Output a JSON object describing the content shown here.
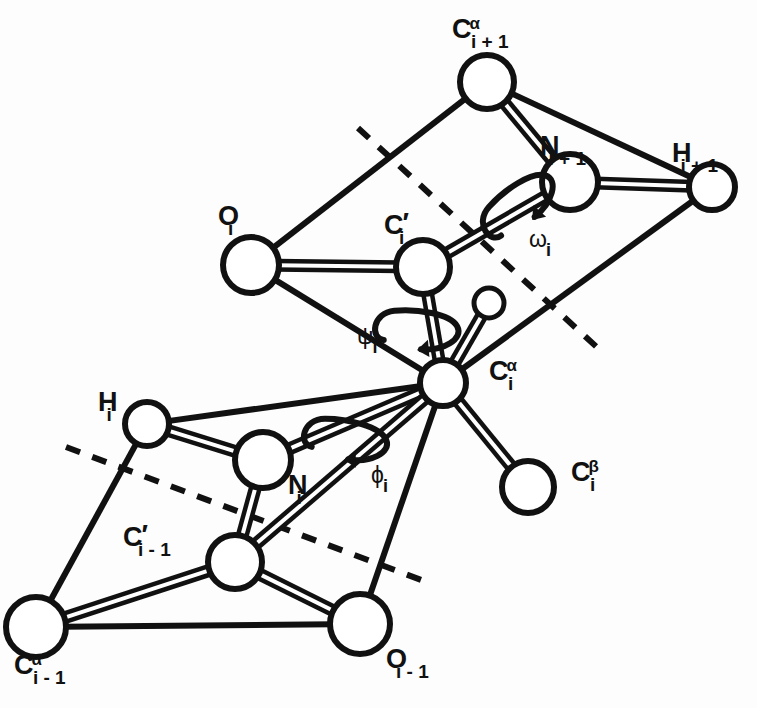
{
  "figure": {
    "kind": "molecular-structure-diagram",
    "background_color": "#ffffff",
    "line_color": "#111111",
    "atom_fill_color": "#ffffff"
  },
  "atoms": [
    {
      "id": "ca_ip1",
      "name": "c-alpha-i-plus-1",
      "base": "C",
      "sup": "α",
      "sub": "i + 1",
      "x": 487,
      "y": 82,
      "r": 27,
      "label_x": 452,
      "label_y": 14
    },
    {
      "id": "n_ip1",
      "name": "n-i-plus-1",
      "base": "N",
      "sup": "",
      "sub": "i + 1",
      "x": 570,
      "y": 182,
      "r": 28,
      "label_x": 540,
      "label_y": 133
    },
    {
      "id": "h_ip1",
      "name": "h-i-plus-1",
      "base": "H",
      "sup": "",
      "sub": "i + 1",
      "x": 712,
      "y": 187,
      "r": 23,
      "label_x": 672,
      "label_y": 140
    },
    {
      "id": "o_i",
      "name": "o-i",
      "base": "O",
      "sup": "",
      "sub": "i",
      "x": 251,
      "y": 265,
      "r": 28,
      "label_x": 218,
      "label_y": 203
    },
    {
      "id": "cp_i",
      "name": "c-prime-i",
      "base": "C",
      "sup": "",
      "sub": "i",
      "x": 423,
      "y": 267,
      "r": 27,
      "label_x": 384,
      "label_y": 212,
      "prime": true
    },
    {
      "id": "h_ca",
      "name": "h-alpha-i",
      "base": "",
      "sup": "",
      "sub": "",
      "x": 489,
      "y": 303,
      "r": 15,
      "label_x": 0,
      "label_y": 0
    },
    {
      "id": "ca_i",
      "name": "c-alpha-i",
      "base": "C",
      "sup": "α",
      "sub": "i",
      "x": 443,
      "y": 383,
      "r": 23,
      "label_x": 489,
      "label_y": 356
    },
    {
      "id": "cb_i",
      "name": "c-beta-i",
      "base": "C",
      "sup": "β",
      "sub": "i",
      "x": 528,
      "y": 487,
      "r": 26,
      "label_x": 571,
      "label_y": 457
    },
    {
      "id": "h_i",
      "name": "h-i",
      "base": "H",
      "sup": "",
      "sub": "i",
      "x": 147,
      "y": 424,
      "r": 22,
      "label_x": 98,
      "label_y": 389
    },
    {
      "id": "n_i",
      "name": "n-i",
      "base": "N",
      "sup": "",
      "sub": "i",
      "x": 263,
      "y": 460,
      "r": 28,
      "label_x": 288,
      "label_y": 472
    },
    {
      "id": "cp_im1",
      "name": "c-prime-i-minus-1",
      "base": "C",
      "sup": "",
      "sub": "i - 1",
      "x": 235,
      "y": 562,
      "r": 27,
      "label_x": 123,
      "label_y": 524,
      "prime": true
    },
    {
      "id": "ca_im1",
      "name": "c-alpha-i-minus-1",
      "base": "C",
      "sup": "α",
      "sub": "i - 1",
      "x": 36,
      "y": 627,
      "r": 30,
      "label_x": 14,
      "label_y": 650
    },
    {
      "id": "o_im1",
      "name": "o-i-minus-1",
      "base": "O",
      "sup": "",
      "sub": "i - 1",
      "x": 360,
      "y": 624,
      "r": 30,
      "label_x": 386,
      "label_y": 646
    }
  ],
  "bonds": [
    {
      "name": "bond-ca-ip1-to-n-ip1",
      "from": "ca_ip1",
      "to": "n_ip1",
      "order": 2
    },
    {
      "name": "bond-ca-ip1-to-h-ip1",
      "from": "ca_ip1",
      "to": "h_ip1",
      "order": 1
    },
    {
      "name": "bond-n-ip1-to-h-ip1",
      "from": "n_ip1",
      "to": "h_ip1",
      "order": 2
    },
    {
      "name": "bond-cp-i-to-n-ip1",
      "from": "cp_i",
      "to": "n_ip1",
      "order": 2
    },
    {
      "name": "bond-cp-i-to-o-i",
      "from": "cp_i",
      "to": "o_i",
      "order": 2
    },
    {
      "name": "bond-o-i-to-ca-ip1",
      "from": "o_i",
      "to": "ca_ip1",
      "order": 1
    },
    {
      "name": "bond-cp-i-to-ca-i",
      "from": "cp_i",
      "to": "ca_i",
      "order": 2
    },
    {
      "name": "bond-o-i-to-ca-i",
      "from": "o_i",
      "to": "ca_i",
      "order": 1
    },
    {
      "name": "bond-ca-i-to-h-ca",
      "from": "ca_i",
      "to": "h_ca",
      "order": 2
    },
    {
      "name": "bond-ca-i-to-cb-i",
      "from": "ca_i",
      "to": "cb_i",
      "order": 2
    },
    {
      "name": "bond-ca-i-to-h-ip1",
      "from": "ca_i",
      "to": "h_ip1",
      "order": 1
    },
    {
      "name": "bond-ca-i-to-n-i",
      "from": "ca_i",
      "to": "n_i",
      "order": 2
    },
    {
      "name": "bond-ca-i-to-h-i",
      "from": "ca_i",
      "to": "h_i",
      "order": 1
    },
    {
      "name": "bond-ca-i-to-cp-im1",
      "from": "ca_i",
      "to": "cp_im1",
      "order": 2
    },
    {
      "name": "bond-ca-i-to-o-im1",
      "from": "ca_i",
      "to": "o_im1",
      "order": 1
    },
    {
      "name": "bond-n-i-to-h-i",
      "from": "n_i",
      "to": "h_i",
      "order": 2
    },
    {
      "name": "bond-n-i-to-cp-im1",
      "from": "n_i",
      "to": "cp_im1",
      "order": 2
    },
    {
      "name": "bond-h-i-to-ca-im1",
      "from": "h_i",
      "to": "ca_im1",
      "order": 1
    },
    {
      "name": "bond-cp-im1-to-ca-im1",
      "from": "cp_im1",
      "to": "ca_im1",
      "order": 2
    },
    {
      "name": "bond-cp-im1-to-o-im1",
      "from": "cp_im1",
      "to": "o_im1",
      "order": 2
    },
    {
      "name": "bond-ca-im1-to-o-im1",
      "from": "ca_im1",
      "to": "o_im1",
      "order": 1
    }
  ],
  "planes": [
    {
      "name": "upper-peptide-plane-dashed-line",
      "x1": 358,
      "y1": 128,
      "x2": 600,
      "y2": 350
    },
    {
      "name": "lower-peptide-plane-dashed-line",
      "x1": 66,
      "y1": 447,
      "x2": 432,
      "y2": 584
    }
  ],
  "torsion_angles": [
    {
      "id": "omega",
      "name": "omega-i",
      "symbol": "ω",
      "sub": "i",
      "label_x": 529,
      "label_y": 228,
      "arc_cx": 518,
      "arc_cy": 202,
      "rot": -38
    },
    {
      "id": "psi",
      "name": "psi-i",
      "symbol": "ψ",
      "sub": "i",
      "label_x": 357,
      "label_y": 325,
      "arc_cx": 419,
      "arc_cy": 327,
      "rot": 5
    },
    {
      "id": "phi",
      "name": "phi-i",
      "symbol": "ϕ",
      "sub": "i",
      "label_x": 371,
      "label_y": 464,
      "arc_cx": 348,
      "arc_cy": 437,
      "rot": 10
    }
  ]
}
